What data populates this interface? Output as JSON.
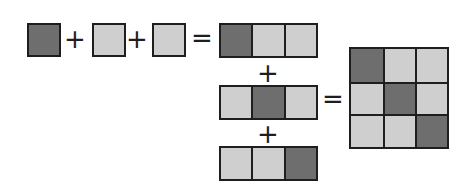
{
  "diagram": {
    "colors": {
      "dark": "#6e6e6e",
      "light": "#cfcfcf",
      "border": "#1e1e1e"
    },
    "operators": {
      "plus": "+",
      "equals": "="
    },
    "left_terms": [
      "dark",
      "light",
      "light"
    ],
    "strips": [
      [
        "dark",
        "light",
        "light"
      ],
      [
        "light",
        "dark",
        "light"
      ],
      [
        "light",
        "light",
        "dark"
      ]
    ],
    "result_grid": [
      [
        "dark",
        "light",
        "light"
      ],
      [
        "light",
        "dark",
        "light"
      ],
      [
        "light",
        "light",
        "dark"
      ]
    ]
  }
}
